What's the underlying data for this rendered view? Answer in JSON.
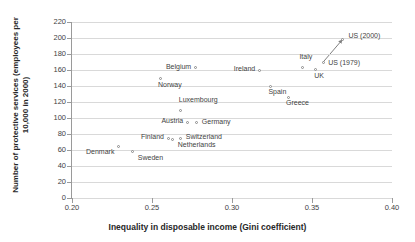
{
  "chart_data": {
    "type": "scatter",
    "title": "",
    "xlabel": "Inequality in disposable income (Gini coefficient)",
    "ylabel": "Number of protective services (employees per 10,000 in 2000)",
    "xlim": [
      0.2,
      0.4
    ],
    "ylim": [
      0,
      220
    ],
    "xticks": [
      "0.20",
      "0.25",
      "0.30",
      "0.35",
      "0.40"
    ],
    "xtick_values": [
      0.2,
      0.25,
      0.3,
      0.35,
      0.4
    ],
    "yticks": [
      "0",
      "20",
      "40",
      "60",
      "80",
      "100",
      "120",
      "140",
      "160",
      "180",
      "200",
      "220"
    ],
    "ytick_values": [
      0,
      20,
      40,
      60,
      80,
      100,
      120,
      140,
      160,
      180,
      200,
      220
    ],
    "grid": "horizontal",
    "legend": "none",
    "points": [
      {
        "label": "Denmark",
        "x": 0.229,
        "y": 64,
        "lx": -4,
        "ly": 5,
        "align": "left"
      },
      {
        "label": "Sweden",
        "x": 0.238,
        "y": 58,
        "lx": 5,
        "ly": 6,
        "align": "right"
      },
      {
        "label": "Norway",
        "x": 0.255,
        "y": 149,
        "lx": -2,
        "ly": 6,
        "align": "right"
      },
      {
        "label": "Finland",
        "x": 0.26,
        "y": 75,
        "lx": -4,
        "ly": -2,
        "align": "left"
      },
      {
        "label": "Netherlands",
        "x": 0.263,
        "y": 73,
        "lx": 5,
        "ly": 5,
        "align": "right"
      },
      {
        "label": "Luxembourg",
        "x": 0.268,
        "y": 110,
        "lx": -2,
        "ly": -11,
        "align": "right"
      },
      {
        "label": "Switzerland",
        "x": 0.268,
        "y": 74,
        "lx": 5,
        "ly": -2,
        "align": "right"
      },
      {
        "label": "Austria",
        "x": 0.272,
        "y": 95,
        "lx": -4,
        "ly": -2,
        "align": "left"
      },
      {
        "label": "Belgium",
        "x": 0.277,
        "y": 163,
        "lx": -4,
        "ly": -1,
        "align": "left"
      },
      {
        "label": "Germany",
        "x": 0.278,
        "y": 94,
        "lx": 5,
        "ly": -1,
        "align": "right"
      },
      {
        "label": "Ireland",
        "x": 0.317,
        "y": 160,
        "lx": -4,
        "ly": -2,
        "align": "left"
      },
      {
        "label": "Spain",
        "x": 0.324,
        "y": 140,
        "lx": -2,
        "ly": 5,
        "align": "right"
      },
      {
        "label": "Greece",
        "x": 0.335,
        "y": 126,
        "lx": -2,
        "ly": 5,
        "align": "right"
      },
      {
        "label": "Italy",
        "x": 0.344,
        "y": 163,
        "lx": -3,
        "ly": -11,
        "align": "right"
      },
      {
        "label": "UK",
        "x": 0.352,
        "y": 161,
        "lx": -1,
        "ly": 6,
        "align": "right"
      },
      {
        "label": "US (1979)",
        "x": 0.357,
        "y": 170,
        "lx": 5,
        "ly": 0,
        "align": "right"
      },
      {
        "label": "US (2000)",
        "x": 0.369,
        "y": 198,
        "lx": 6,
        "ly": -4,
        "align": "right"
      }
    ],
    "annotation_arrow": {
      "from_label": "US (1979)",
      "to_label": "US (2000)",
      "from_x": 0.357,
      "from_y": 170,
      "to_x": 0.369,
      "to_y": 198,
      "color": "#7f7f7f"
    },
    "colors": {
      "marker_stroke": "#8a8a8a",
      "marker_fill": "#ffffff",
      "gridline": "#d9d9d9",
      "axis": "#9a9a9a",
      "text": "#3f3f3f",
      "title_text": "#272727",
      "background": "#ffffff"
    }
  }
}
